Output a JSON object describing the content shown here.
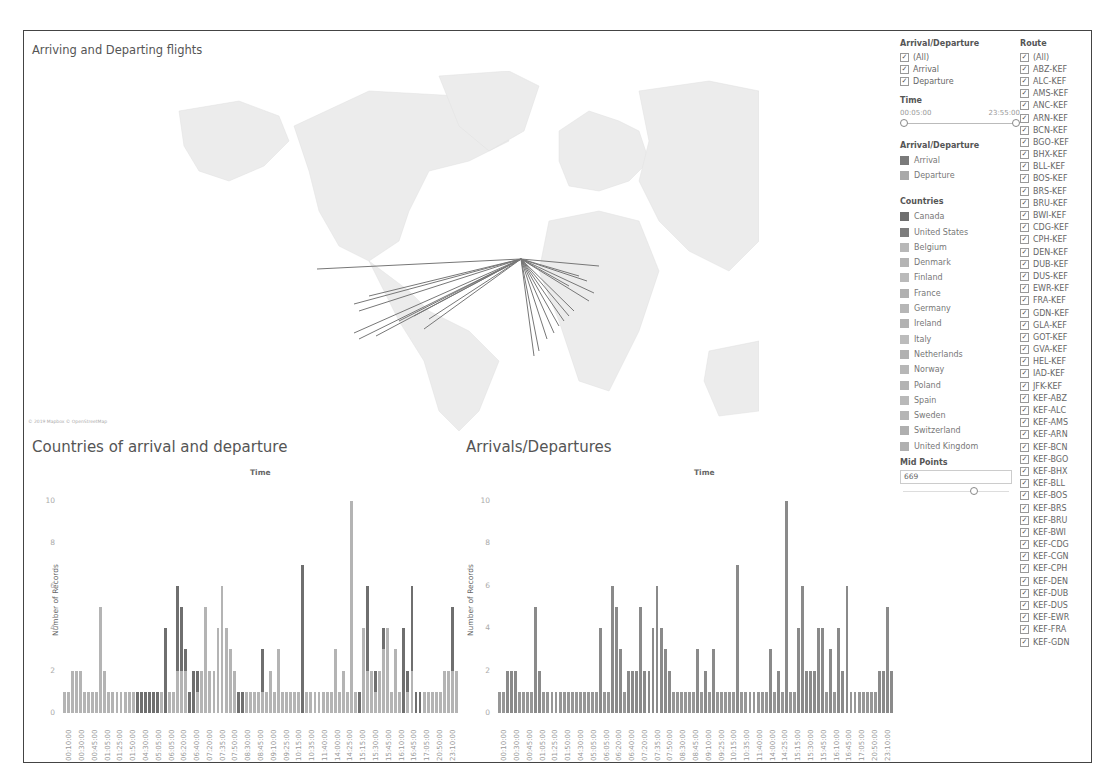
{
  "dashboard": {
    "map_title": "Arriving and Departing flights",
    "map_attribution": "© 2019 Mapbox © OpenStreetMap",
    "chart1_title": "Countries of arrival and departure",
    "chart2_title": "Arrivals/Departures"
  },
  "filters": {
    "arrival_departure": {
      "title": "Arrival/Departure",
      "options": [
        {
          "label": "(All)",
          "checked": true
        },
        {
          "label": "Arrival",
          "checked": true
        },
        {
          "label": "Departure",
          "checked": true
        }
      ]
    },
    "time": {
      "title": "Time",
      "min": "00:05:00",
      "max": "23:55:00"
    },
    "mid_points": {
      "title": "Mid Points",
      "value": "669"
    },
    "route": {
      "title": "Route",
      "options": [
        "(All)",
        "ABZ-KEF",
        "ALC-KEF",
        "AMS-KEF",
        "ANC-KEF",
        "ARN-KEF",
        "BCN-KEF",
        "BGO-KEF",
        "BHX-KEF",
        "BLL-KEF",
        "BOS-KEF",
        "BRS-KEF",
        "BRU-KEF",
        "BWI-KEF",
        "CDG-KEF",
        "CPH-KEF",
        "DEN-KEF",
        "DUB-KEF",
        "DUS-KEF",
        "EWR-KEF",
        "FRA-KEF",
        "GDN-KEF",
        "GLA-KEF",
        "GOT-KEF",
        "GVA-KEF",
        "HEL-KEF",
        "IAD-KEF",
        "JFK-KEF",
        "KEF-ABZ",
        "KEF-ALC",
        "KEF-AMS",
        "KEF-ARN",
        "KEF-BCN",
        "KEF-BGO",
        "KEF-BHX",
        "KEF-BLL",
        "KEF-BOS",
        "KEF-BRS",
        "KEF-BRU",
        "KEF-BWI",
        "KEF-CDG",
        "KEF-CGN",
        "KEF-CPH",
        "KEF-DEN",
        "KEF-DUB",
        "KEF-DUS",
        "KEF-EWR",
        "KEF-FRA",
        "KEF-GDN"
      ]
    }
  },
  "legends": {
    "arrival_departure": {
      "title": "Arrival/Departure",
      "items": [
        {
          "label": "Arrival",
          "color": "#7a7a7a"
        },
        {
          "label": "Departure",
          "color": "#a9a9a9"
        }
      ]
    },
    "countries": {
      "title": "Countries",
      "items": [
        {
          "label": "Canada",
          "color": "#6e6e6e"
        },
        {
          "label": "United States",
          "color": "#7d7d7d"
        },
        {
          "label": "Belgium",
          "color": "#b8b8b8"
        },
        {
          "label": "Denmark",
          "color": "#b4b4b4"
        },
        {
          "label": "Finland",
          "color": "#bababa"
        },
        {
          "label": "France",
          "color": "#b0b0b0"
        },
        {
          "label": "Germany",
          "color": "#b6b6b6"
        },
        {
          "label": "Ireland",
          "color": "#b2b2b2"
        },
        {
          "label": "Italy",
          "color": "#bcbcbc"
        },
        {
          "label": "Netherlands",
          "color": "#b1b1b1"
        },
        {
          "label": "Norway",
          "color": "#b7b7b7"
        },
        {
          "label": "Poland",
          "color": "#b3b3b3"
        },
        {
          "label": "Spain",
          "color": "#b9b9b9"
        },
        {
          "label": "Sweden",
          "color": "#b5b5b5"
        },
        {
          "label": "Switzerland",
          "color": "#afafaf"
        },
        {
          "label": "United Kingdom",
          "color": "#b0b0b0"
        }
      ]
    }
  },
  "chart_data": [
    {
      "type": "bar",
      "title": "Countries of arrival and departure",
      "xlabel": "Time",
      "ylabel": "Number of Records",
      "ylim": [
        0,
        10
      ],
      "yticks": [
        0,
        2,
        4,
        6,
        8,
        10
      ],
      "stacked": true,
      "tick_labels": [
        "00:10:00",
        "00:30:00",
        "00:45:00",
        "01:05:00",
        "01:25:00",
        "01:50:00",
        "04:30:00",
        "05:05:00",
        "06:05:00",
        "06:20:00",
        "06:40:00",
        "07:20:00",
        "07:35:00",
        "07:50:00",
        "08:30:00",
        "08:45:00",
        "09:10:00",
        "09:25:00",
        "10:15:00",
        "10:35:00",
        "11:40:00",
        "14:00:00",
        "14:25:00",
        "15:15:00",
        "15:30:00",
        "15:45:00",
        "16:10:00",
        "16:45:00",
        "17:05:00",
        "20:50:00",
        "23:10:00"
      ],
      "values": [
        1,
        1,
        2,
        2,
        2,
        1,
        1,
        1,
        1,
        5,
        2,
        1,
        1,
        1,
        1,
        1,
        1,
        1,
        1,
        1,
        1,
        1,
        1,
        1,
        1,
        4,
        1,
        1,
        6,
        5,
        3,
        1,
        2,
        2,
        2,
        5,
        2,
        2,
        4,
        6,
        4,
        3,
        2,
        1,
        1,
        1,
        1,
        1,
        1,
        3,
        1,
        2,
        1,
        3,
        1,
        1,
        1,
        1,
        1,
        7,
        1,
        1,
        1,
        1,
        1,
        1,
        1,
        3,
        1,
        2,
        1,
        10,
        1,
        1,
        4,
        6,
        2,
        2,
        2,
        4,
        4,
        1,
        3,
        1,
        4,
        2,
        6,
        1,
        1,
        1,
        1,
        1,
        1,
        1,
        2,
        2,
        5,
        2
      ],
      "dark_portion": [
        0,
        0,
        0,
        0,
        0,
        0,
        0,
        0,
        0,
        0,
        0,
        0,
        0,
        0,
        0,
        0,
        0,
        0,
        1,
        1,
        1,
        1,
        1,
        1,
        0,
        4,
        0,
        0,
        4,
        3,
        1,
        1,
        2,
        1,
        0,
        0,
        0,
        0,
        0,
        0,
        0,
        0,
        0,
        1,
        1,
        0,
        0,
        0,
        0,
        2,
        0,
        0,
        0,
        0,
        0,
        0,
        0,
        0,
        0,
        7,
        0,
        0,
        0,
        0,
        0,
        0,
        0,
        0,
        0,
        0,
        0,
        0,
        0,
        1,
        0,
        4,
        0,
        1,
        0,
        1,
        0,
        0,
        0,
        0,
        4,
        1,
        4,
        1,
        1,
        0,
        0,
        0,
        0,
        0,
        0,
        0,
        3,
        0
      ]
    },
    {
      "type": "bar",
      "title": "Arrivals/Departures",
      "xlabel": "Time",
      "ylabel": "Number of Records",
      "ylim": [
        0,
        10
      ],
      "yticks": [
        0,
        2,
        4,
        6,
        8,
        10
      ],
      "tick_labels": [
        "00:10:00",
        "00:30:00",
        "00:45:00",
        "01:05:00",
        "01:25:00",
        "01:50:00",
        "04:30:00",
        "05:05:00",
        "06:05:00",
        "06:20:00",
        "06:40:00",
        "07:20:00",
        "07:35:00",
        "07:50:00",
        "08:30:00",
        "08:45:00",
        "09:10:00",
        "09:25:00",
        "10:15:00",
        "10:35:00",
        "11:40:00",
        "14:00:00",
        "14:25:00",
        "15:15:00",
        "15:30:00",
        "15:45:00",
        "16:10:00",
        "16:45:00",
        "17:05:00",
        "20:50:00",
        "23:10:00"
      ],
      "values": [
        1,
        1,
        2,
        2,
        2,
        1,
        1,
        1,
        1,
        5,
        2,
        1,
        1,
        1,
        1,
        1,
        1,
        1,
        1,
        1,
        1,
        1,
        1,
        1,
        1,
        4,
        1,
        1,
        6,
        5,
        3,
        1,
        2,
        2,
        2,
        5,
        2,
        2,
        4,
        6,
        4,
        3,
        2,
        1,
        1,
        1,
        1,
        1,
        1,
        3,
        1,
        2,
        1,
        3,
        1,
        1,
        1,
        1,
        1,
        7,
        1,
        1,
        1,
        1,
        1,
        1,
        1,
        3,
        1,
        2,
        1,
        10,
        1,
        1,
        4,
        6,
        2,
        2,
        2,
        4,
        4,
        1,
        3,
        1,
        4,
        2,
        6,
        1,
        1,
        1,
        1,
        1,
        1,
        1,
        2,
        2,
        5,
        2
      ]
    }
  ]
}
